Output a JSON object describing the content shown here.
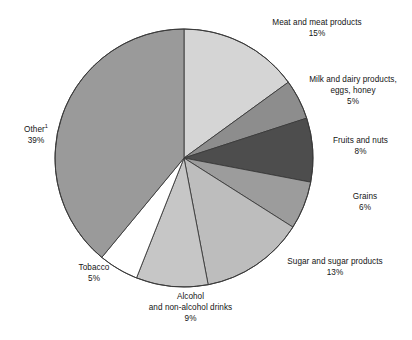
{
  "chart_data": {
    "type": "pie",
    "title": "",
    "subtitle": "",
    "xlabel": "",
    "ylabel": "",
    "legend_position": "outside-labels",
    "grid": false,
    "unit": "%",
    "start_angle_deg": 0,
    "direction": "clockwise",
    "categories": [
      "Meat and meat products",
      "Milk and dairy products, eggs, honey",
      "Fruits and nuts",
      "Grains",
      "Sugar and sugar products",
      "Alcohol and non-alcohol drinks",
      "Tobacco",
      "Other"
    ],
    "values": [
      15,
      5,
      8,
      6,
      13,
      9,
      5,
      39
    ],
    "slices": [
      {
        "name": "meat-and-meat-products",
        "label_lines": [
          "Meat and meat products",
          "15%"
        ],
        "value": 15,
        "value_text": "15%",
        "color": "#d5d5d5"
      },
      {
        "name": "milk-dairy-eggs-honey",
        "label_lines": [
          "Milk and dairy products,",
          "eggs, honey",
          "5%"
        ],
        "value": 5,
        "value_text": "5%",
        "color": "#8d8d8d"
      },
      {
        "name": "fruits-and-nuts",
        "label_lines": [
          "Fruits and nuts",
          "8%"
        ],
        "value": 8,
        "value_text": "8%",
        "color": "#4d4d4d"
      },
      {
        "name": "grains",
        "label_lines": [
          "Grains",
          "6%"
        ],
        "value": 6,
        "value_text": "6%",
        "color": "#9c9c9c"
      },
      {
        "name": "sugar-and-sugar-products",
        "label_lines": [
          "Sugar and sugar products",
          "13%"
        ],
        "value": 13,
        "value_text": "13%",
        "color": "#bdbdbd"
      },
      {
        "name": "alcohol-and-non-alcohol-drinks",
        "label_lines": [
          "Alcohol",
          "and non-alcohol drinks",
          "9%"
        ],
        "value": 9,
        "value_text": "9%",
        "color": "#c6c6c6"
      },
      {
        "name": "tobacco",
        "label_lines": [
          "Tobacco",
          "5%"
        ],
        "value": 5,
        "value_text": "5%",
        "color": "#ffffff"
      },
      {
        "name": "other",
        "label_lines": [
          "Other",
          "39%"
        ],
        "label_footnote": "1",
        "value": 39,
        "value_text": "39%",
        "color": "#9a9a9a"
      }
    ],
    "stroke_color": "#3a3a3a",
    "background": "#ffffff"
  },
  "labels": {
    "meat": {
      "line1": "Meat and meat products",
      "line2": "15%"
    },
    "milk": {
      "line1": "Milk and dairy products,",
      "line2": "eggs, honey",
      "line3": "5%"
    },
    "fruits": {
      "line1": "Fruits and nuts",
      "line2": "8%"
    },
    "grains": {
      "line1": "Grains",
      "line2": "6%"
    },
    "sugar": {
      "line1": "Sugar and sugar products",
      "line2": "13%"
    },
    "alcohol": {
      "line1": "Alcohol",
      "line2": "and non-alcohol drinks",
      "line3": "9%"
    },
    "tobacco": {
      "line1": "Tobacco",
      "line2": "5%"
    },
    "other": {
      "line1": "Other",
      "footnote": "1",
      "line2": "39%"
    }
  }
}
